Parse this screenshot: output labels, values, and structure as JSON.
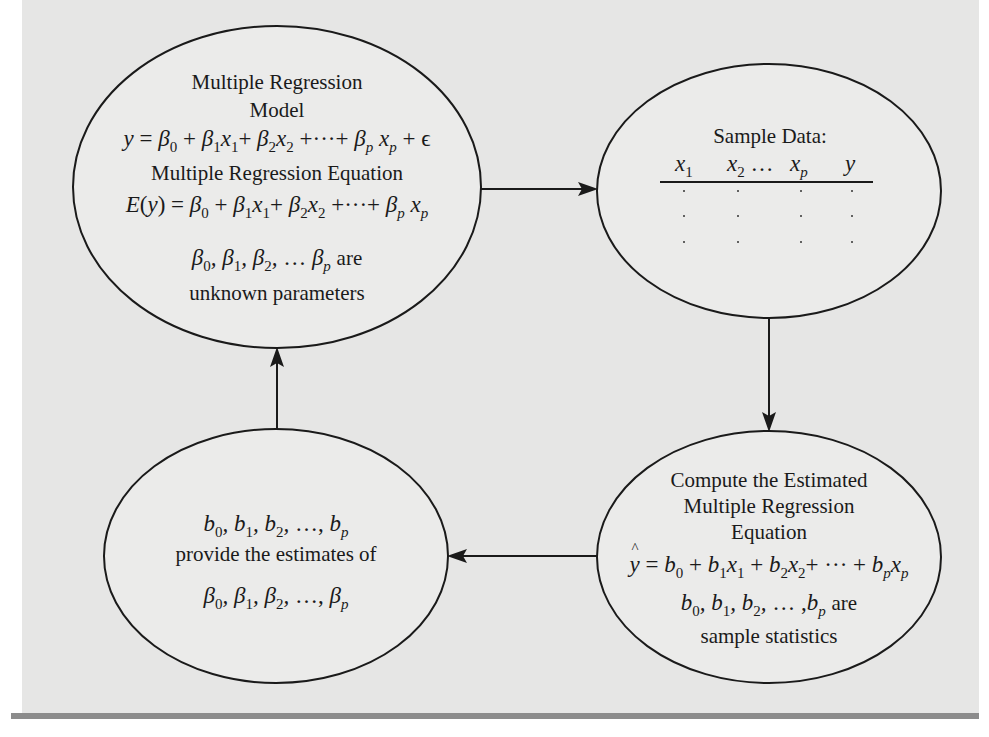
{
  "figure": {
    "background_color": "#e6e6e5",
    "rule_color": "#8c8c8c",
    "stroke_color": "#1a1a1a"
  },
  "nodes": {
    "model": {
      "title_line1": "Multiple Regression",
      "title_line2": "Model",
      "model_equation": "y = β0 + β1x1 + β2x2 + ··· + βpxp + ε",
      "equation_title": "Multiple Regression Equation",
      "expected_equation": "E(y) = β0 + β1x1 + β2x2 + ··· + βpxp",
      "params_line": "β0, β1, β2, … βp are",
      "params_caption": "unknown parameters"
    },
    "sample": {
      "title": "Sample Data:",
      "columns": [
        "x1",
        "x2 …",
        "xp",
        "y"
      ],
      "rows": [
        [
          ".",
          ".",
          ".",
          "."
        ],
        [
          ".",
          ".",
          ".",
          "."
        ],
        [
          ".",
          ".",
          ".",
          "."
        ]
      ]
    },
    "compute": {
      "title_line1": "Compute the Estimated",
      "title_line2": "Multiple Regression",
      "title_line3": "Equation",
      "estimated_equation": "ŷ = b0 + b1x1 + b2x2 + ··· + bpxp",
      "stats_line": "b0, b1, b2, … ,bp are",
      "stats_caption": "sample statistics"
    },
    "estimates": {
      "b_line": "b0, b1, b2, …, bp",
      "caption": "provide the estimates of",
      "beta_line": "β0, β1, β2, …, βp"
    }
  },
  "arrows": [
    {
      "from": "model",
      "to": "sample",
      "direction": "right"
    },
    {
      "from": "sample",
      "to": "compute",
      "direction": "down"
    },
    {
      "from": "compute",
      "to": "estimates",
      "direction": "left"
    },
    {
      "from": "estimates",
      "to": "model",
      "direction": "up"
    }
  ],
  "glyphs": {
    "beta": "β",
    "epsilon": "ϵ",
    "ellipsis": "…",
    "cdots": "···",
    "plus": "+",
    "equals": "=",
    "comma": ","
  }
}
